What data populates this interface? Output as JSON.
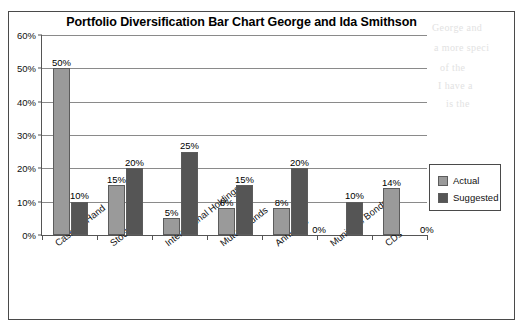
{
  "chart_data": {
    "type": "bar",
    "title": "Portfolio Diversification Bar Chart George and Ida Smithson",
    "xlabel": "",
    "ylabel": "",
    "ylim": [
      0,
      60
    ],
    "ytick_labels": [
      "0%",
      "10%",
      "20%",
      "30%",
      "40%",
      "50%",
      "60%"
    ],
    "ytick_values": [
      0,
      10,
      20,
      30,
      40,
      50,
      60
    ],
    "grid": true,
    "legend_position": "right",
    "categories": [
      "Cash on Hand",
      "Stocks",
      "International Holdings",
      "Mutual Funds",
      "Annuities",
      "Municipal Bonds",
      "CDs"
    ],
    "series": [
      {
        "name": "Actual",
        "color": "#9a9a9a",
        "values": [
          50,
          15,
          5,
          8,
          8,
          0,
          14
        ],
        "labels": [
          "50%",
          "15%",
          "5%",
          "8%",
          "8%",
          "0%",
          "14%"
        ]
      },
      {
        "name": "Suggested",
        "color": "#555555",
        "values": [
          10,
          20,
          25,
          15,
          20,
          10,
          0
        ],
        "labels": [
          "10%",
          "20%",
          "25%",
          "15%",
          "20%",
          "10%",
          "0%"
        ]
      }
    ]
  },
  "legend": {
    "entries": [
      {
        "label": "Actual",
        "color": "#9a9a9a"
      },
      {
        "label": "Suggested",
        "color": "#555555"
      }
    ]
  },
  "background_bleed": [
    "George and",
    "a more speci",
    "of the",
    "I have a",
    "is the"
  ]
}
